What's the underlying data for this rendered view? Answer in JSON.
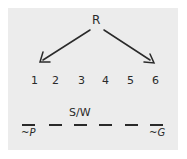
{
  "diagram": {
    "root_label": "R",
    "positions": [
      "1",
      "2",
      "3",
      "4",
      "5",
      "6"
    ],
    "slot_above_label": "S/W",
    "slot_above_index": 3,
    "left_constraint": "~P",
    "right_constraint": "~G",
    "arrows": [
      {
        "from": "R",
        "to": "1"
      },
      {
        "from": "R",
        "to": "6"
      }
    ]
  }
}
